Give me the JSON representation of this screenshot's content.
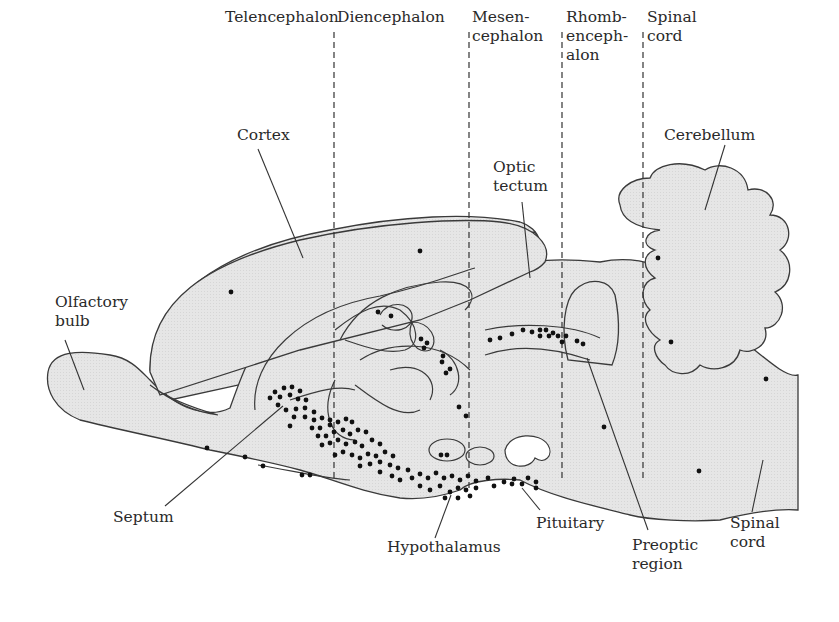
{
  "diagram": {
    "type": "sagittal brain section with labeled regions and dots marking cell locations",
    "colors": {
      "tissue_fill": "#e4e4e4",
      "outline": "#3a3a3a",
      "dots": "#111111",
      "divider": "#333333",
      "text": "#2a2a2a"
    },
    "divisions": [
      {
        "label": "Telencephalon"
      },
      {
        "label": "Diencephalon"
      },
      {
        "label": "Mesen-\ncephalon"
      },
      {
        "label": "Rhomb-\nenceph-\nalon"
      },
      {
        "label": "Spinal\ncord"
      }
    ],
    "labels": {
      "cortex": "Cortex",
      "olfactory_bulb": "Olfactory\nbulb",
      "optic_tectum": "Optic\ntectum",
      "cerebellum": "Cerebellum",
      "septum": "Septum",
      "hypothalamus": "Hypothalamus",
      "pituitary": "Pituitary",
      "preoptic_region": "Preoptic\nregion",
      "spinal_cord": "Spinal\ncord"
    }
  }
}
